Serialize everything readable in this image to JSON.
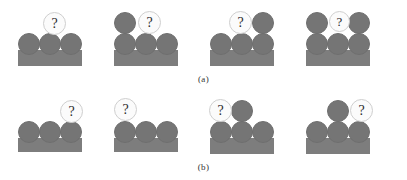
{
  "figure": {
    "title": "",
    "background_color": "#ffffff",
    "block_color": "#757575",
    "base_color": "#7d7d7d",
    "bubble_fill_color": "#fbfbfb",
    "bubble_border_color": "#cfcfcf",
    "question_glyph": "?",
    "rows": [
      {
        "id": "a",
        "caption": "(a)",
        "panels": [
          {
            "id": "a1",
            "name": "panel-a-1",
            "base": {
              "x": 18,
              "y": 48,
              "w": 64,
              "h": 16
            },
            "blocks": [
              {
                "name": "block-base-left",
                "x": 18,
                "y": 31,
                "d": 22
              },
              {
                "name": "block-base-middle",
                "x": 39,
                "y": 31,
                "d": 22
              },
              {
                "name": "block-base-right",
                "x": 60,
                "y": 31,
                "d": 22
              }
            ],
            "bubble": {
              "name": "question-bubble",
              "x": 43,
              "y": 10,
              "d": 23,
              "label": "?"
            }
          },
          {
            "id": "a2",
            "name": "panel-a-2",
            "base": {
              "x": 114,
              "y": 48,
              "w": 64,
              "h": 16
            },
            "blocks": [
              {
                "name": "block-base-left",
                "x": 114,
                "y": 31,
                "d": 22
              },
              {
                "name": "block-base-middle",
                "x": 135,
                "y": 31,
                "d": 22
              },
              {
                "name": "block-base-right",
                "x": 156,
                "y": 31,
                "d": 22
              },
              {
                "name": "block-stacked-on-left",
                "x": 114,
                "y": 10,
                "d": 22
              }
            ],
            "bubble": {
              "name": "question-bubble",
              "x": 138,
              "y": 9,
              "d": 23,
              "label": "?"
            }
          },
          {
            "id": "a3",
            "name": "panel-a-3",
            "base": {
              "x": 210,
              "y": 48,
              "w": 64,
              "h": 16
            },
            "blocks": [
              {
                "name": "block-base-left",
                "x": 210,
                "y": 31,
                "d": 22
              },
              {
                "name": "block-base-middle",
                "x": 231,
                "y": 31,
                "d": 22
              },
              {
                "name": "block-base-right",
                "x": 252,
                "y": 31,
                "d": 22
              },
              {
                "name": "block-stacked-on-right",
                "x": 252,
                "y": 10,
                "d": 22
              }
            ],
            "bubble": {
              "name": "question-bubble",
              "x": 229,
              "y": 9,
              "d": 23,
              "label": "?"
            }
          },
          {
            "id": "a4",
            "name": "panel-a-4",
            "base": {
              "x": 306,
              "y": 48,
              "w": 64,
              "h": 16
            },
            "blocks": [
              {
                "name": "block-base-left",
                "x": 306,
                "y": 31,
                "d": 22
              },
              {
                "name": "block-base-middle",
                "x": 327,
                "y": 31,
                "d": 22
              },
              {
                "name": "block-base-right",
                "x": 348,
                "y": 31,
                "d": 22
              },
              {
                "name": "block-stacked-on-left",
                "x": 306,
                "y": 10,
                "d": 22
              },
              {
                "name": "block-stacked-on-right",
                "x": 348,
                "y": 10,
                "d": 22
              }
            ],
            "bubble": {
              "name": "question-bubble",
              "x": 329,
              "y": 9,
              "d": 21,
              "label": "?"
            }
          }
        ]
      },
      {
        "id": "b",
        "caption": "(b)",
        "panels": [
          {
            "id": "b1",
            "name": "panel-b-1",
            "base": {
              "x": 18,
              "y": 48,
              "w": 64,
              "h": 14
            },
            "blocks": [
              {
                "name": "block-base-left",
                "x": 18,
                "y": 31,
                "d": 22
              },
              {
                "name": "block-base-middle",
                "x": 39,
                "y": 31,
                "d": 22
              },
              {
                "name": "block-base-right",
                "x": 60,
                "y": 31,
                "d": 22
              }
            ],
            "bubble": {
              "name": "question-bubble",
              "x": 60,
              "y": 10,
              "d": 23,
              "label": "?"
            }
          },
          {
            "id": "b2",
            "name": "panel-b-2",
            "base": {
              "x": 114,
              "y": 48,
              "w": 64,
              "h": 14
            },
            "blocks": [
              {
                "name": "block-base-left",
                "x": 114,
                "y": 31,
                "d": 22
              },
              {
                "name": "block-base-middle",
                "x": 135,
                "y": 31,
                "d": 22
              },
              {
                "name": "block-base-right",
                "x": 156,
                "y": 31,
                "d": 22
              }
            ],
            "bubble": {
              "name": "question-bubble",
              "x": 114,
              "y": 8,
              "d": 23,
              "label": "?"
            }
          },
          {
            "id": "b3",
            "name": "panel-b-3",
            "base": {
              "x": 210,
              "y": 48,
              "w": 64,
              "h": 16
            },
            "blocks": [
              {
                "name": "block-base-left",
                "x": 210,
                "y": 31,
                "d": 22
              },
              {
                "name": "block-base-middle",
                "x": 231,
                "y": 31,
                "d": 22
              },
              {
                "name": "block-base-right",
                "x": 252,
                "y": 31,
                "d": 22
              },
              {
                "name": "block-stacked-on-middle",
                "x": 231,
                "y": 10,
                "d": 22
              }
            ],
            "bubble": {
              "name": "question-bubble",
              "x": 209,
              "y": 9,
              "d": 23,
              "label": "?"
            }
          },
          {
            "id": "b4",
            "name": "panel-b-4",
            "base": {
              "x": 306,
              "y": 48,
              "w": 64,
              "h": 16
            },
            "blocks": [
              {
                "name": "block-base-left",
                "x": 306,
                "y": 31,
                "d": 22
              },
              {
                "name": "block-base-middle",
                "x": 327,
                "y": 31,
                "d": 22
              },
              {
                "name": "block-base-right",
                "x": 348,
                "y": 31,
                "d": 22
              },
              {
                "name": "block-stacked-on-middle",
                "x": 327,
                "y": 10,
                "d": 22
              }
            ],
            "bubble": {
              "name": "question-bubble",
              "x": 350,
              "y": 9,
              "d": 23,
              "label": "?"
            }
          }
        ]
      }
    ]
  }
}
